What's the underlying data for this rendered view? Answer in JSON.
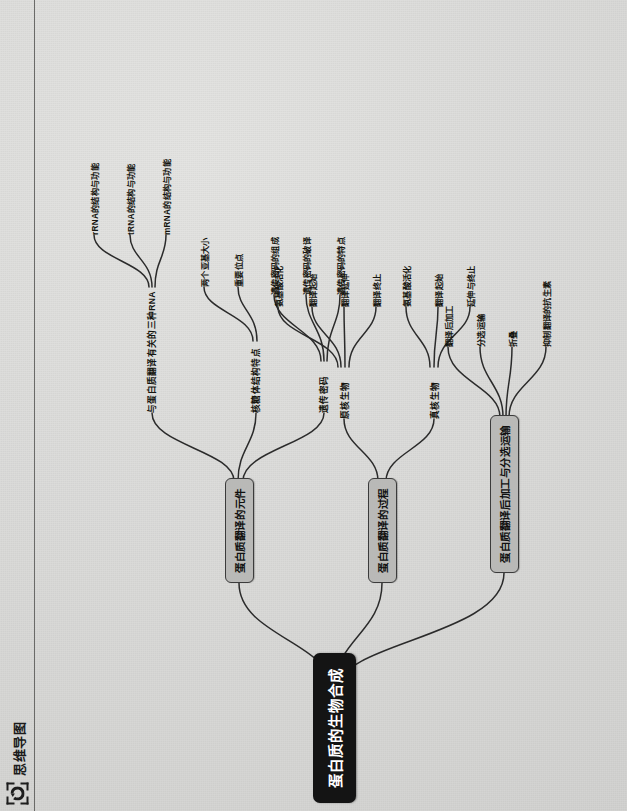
{
  "header": {
    "title": "思维导图",
    "icon": "refresh-circle-icon"
  },
  "colors": {
    "background": "#d9d9d7",
    "root_bg": "#141414",
    "root_text": "#ffffff",
    "branch_bg": "#b9b9b7",
    "branch_border": "#3b3b3b",
    "edge": "#2b2b2b",
    "text": "#15150f"
  },
  "mindmap": {
    "root": "蛋白质的生物合成",
    "branches": [
      {
        "label": "蛋白质翻译的元件",
        "children": [
          {
            "label": "与蛋白质翻译有关的三种RNA",
            "children": [
              {
                "label": "rRNA的结构与功能"
              },
              {
                "label": "tRNA的结构与功能"
              },
              {
                "label": "mRNA的结构与功能"
              }
            ]
          },
          {
            "label": "核糖体结构特点",
            "children": [
              {
                "label": "两个亚基大小"
              },
              {
                "label": "重要位点"
              }
            ]
          },
          {
            "label": "遗传密码",
            "children": [
              {
                "label": "遗传密码的组成"
              },
              {
                "label": "遗传密码的破译"
              },
              {
                "label": "遗传密码的特点"
              }
            ]
          }
        ]
      },
      {
        "label": "蛋白质翻译的过程",
        "children": [
          {
            "label": "原核生物",
            "children": [
              {
                "label": "氨基酸活化"
              },
              {
                "label": "翻译起始"
              },
              {
                "label": "翻译延伸"
              },
              {
                "label": "翻译终止"
              }
            ]
          },
          {
            "label": "真核生物",
            "children": [
              {
                "label": "氨基酸活化"
              },
              {
                "label": "翻译起始"
              },
              {
                "label": "延伸与终止"
              }
            ]
          }
        ]
      },
      {
        "label": "蛋白质翻译后加工与分选运输",
        "children": [
          {
            "label": "",
            "children": [
              {
                "label": "翻译后加工"
              },
              {
                "label": "分选运输"
              },
              {
                "label": "折叠"
              },
              {
                "label": "抑制翻译的抗生素"
              }
            ]
          }
        ]
      }
    ]
  }
}
